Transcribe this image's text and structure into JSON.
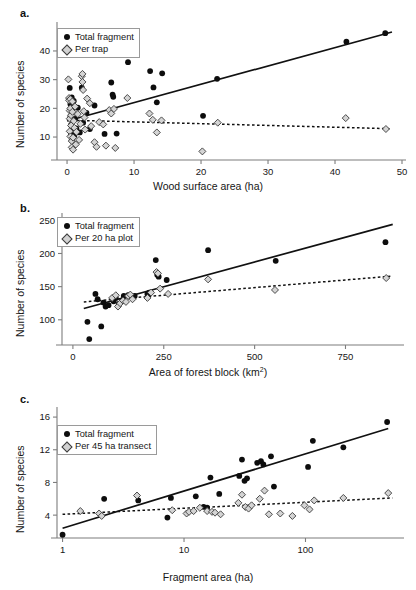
{
  "figure": {
    "panels": [
      {
        "label": "a.",
        "xlabel": "Wood surface area (ha)",
        "ylabel": "Number of species",
        "legend": [
          {
            "marker": "filled-circle",
            "label": "Total fragment"
          },
          {
            "marker": "gray-diamond",
            "label": "Per trap"
          }
        ]
      },
      {
        "label": "b.",
        "xlabel": "Area of forest block (km²)",
        "ylabel": "Number of species",
        "legend": [
          {
            "marker": "filled-circle",
            "label": "Total fragment"
          },
          {
            "marker": "gray-diamond",
            "label": "Per 20 ha plot"
          }
        ]
      },
      {
        "label": "c.",
        "xlabel": "Fragment area (ha)",
        "ylabel": "Number of species",
        "legend": [
          {
            "marker": "filled-circle",
            "label": "Total fragment"
          },
          {
            "marker": "gray-diamond",
            "label": "Per 45 ha transect"
          }
        ]
      }
    ]
  },
  "chart_data": [
    {
      "type": "scatter",
      "panel": "a.",
      "title": "",
      "xlabel": "Wood surface area (ha)",
      "ylabel": "Number of species",
      "xscale": "linear",
      "yscale": "linear",
      "xlim": [
        -1.5,
        50
      ],
      "ylim": [
        2,
        48
      ],
      "xticks": [
        0,
        10,
        20,
        30,
        40,
        50
      ],
      "yticks": [
        10,
        20,
        30,
        40
      ],
      "grid": false,
      "legend_position": "top-left",
      "series": [
        {
          "name": "Total fragment",
          "marker": "filled-circle",
          "color": "#0d0d0d",
          "points": [
            [
              0.4,
              27.1
            ],
            [
              0.5,
              21.5
            ],
            [
              0.5,
              17.0
            ],
            [
              0.6,
              14.2
            ],
            [
              0.6,
              11.0
            ],
            [
              0.7,
              23.8
            ],
            [
              0.7,
              9.0
            ],
            [
              0.8,
              19.5
            ],
            [
              0.9,
              12.4
            ],
            [
              1.0,
              22.6
            ],
            [
              1.1,
              10.5
            ],
            [
              1.2,
              16.3
            ],
            [
              1.4,
              13.0
            ],
            [
              1.6,
              20.2
            ],
            [
              1.9,
              11.6
            ],
            [
              2.2,
              27.2
            ],
            [
              2.4,
              15.0
            ],
            [
              2.9,
              18.4
            ],
            [
              3.4,
              12.8
            ],
            [
              4.1,
              21.0
            ],
            [
              5.6,
              11.1
            ],
            [
              6.6,
              29.0
            ],
            [
              6.8,
              24.8
            ],
            [
              6.9,
              24.0
            ],
            [
              7.4,
              11.2
            ],
            [
              9.1,
              36.1
            ],
            [
              12.4,
              33.0
            ],
            [
              12.9,
              27.3
            ],
            [
              13.4,
              22.1
            ],
            [
              14.2,
              32.2
            ],
            [
              20.3,
              17.4
            ],
            [
              22.4,
              30.3
            ],
            [
              41.7,
              43.2
            ],
            [
              47.5,
              46.2
            ]
          ]
        },
        {
          "name": "Per trap",
          "marker": "gray-diamond",
          "color": "#d2d2d2",
          "points": [
            [
              0.2,
              30.1
            ],
            [
              0.3,
              23.6
            ],
            [
              0.3,
              22.8
            ],
            [
              0.4,
              19.2
            ],
            [
              0.4,
              16.4
            ],
            [
              0.4,
              12.0
            ],
            [
              0.5,
              23.2
            ],
            [
              0.5,
              20.0
            ],
            [
              0.5,
              10.2
            ],
            [
              0.6,
              17.6
            ],
            [
              0.6,
              14.0
            ],
            [
              0.7,
              8.6
            ],
            [
              0.7,
              6.4
            ],
            [
              0.8,
              22.4
            ],
            [
              0.8,
              18.8
            ],
            [
              0.9,
              5.6
            ],
            [
              0.9,
              9.8
            ],
            [
              1.0,
              15.6
            ],
            [
              1.1,
              13.2
            ],
            [
              1.2,
              20.6
            ],
            [
              1.3,
              7.4
            ],
            [
              1.4,
              11.8
            ],
            [
              1.6,
              18.0
            ],
            [
              1.8,
              9.0
            ],
            [
              2.0,
              14.6
            ],
            [
              2.2,
              31.2
            ],
            [
              2.3,
              32.0
            ],
            [
              2.3,
              29.2
            ],
            [
              2.4,
              26.4
            ],
            [
              2.5,
              19.0
            ],
            [
              2.6,
              16.8
            ],
            [
              2.7,
              12.6
            ],
            [
              3.0,
              23.4
            ],
            [
              3.4,
              21.8
            ],
            [
              3.6,
              13.8
            ],
            [
              4.1,
              8.2
            ],
            [
              4.4,
              6.6
            ],
            [
              4.8,
              15.2
            ],
            [
              5.4,
              14.4
            ],
            [
              5.8,
              7.0
            ],
            [
              6.3,
              19.4
            ],
            [
              6.6,
              18.2
            ],
            [
              7.0,
              19.8
            ],
            [
              7.2,
              6.2
            ],
            [
              9.0,
              23.6
            ],
            [
              12.3,
              18.2
            ],
            [
              12.8,
              16.0
            ],
            [
              13.4,
              11.6
            ],
            [
              14.1,
              15.8
            ],
            [
              20.2,
              5.0
            ],
            [
              22.5,
              15.0
            ],
            [
              41.6,
              16.6
            ],
            [
              47.6,
              12.8
            ]
          ]
        }
      ],
      "trendlines": [
        {
          "name": "Total fragment fit",
          "style": "solid",
          "x": [
            0,
            48.5
          ],
          "y": [
            15.6,
            46.6
          ]
        },
        {
          "name": "Per trap fit",
          "style": "dashed",
          "x": [
            0,
            48.5
          ],
          "y": [
            15.9,
            12.9
          ]
        }
      ]
    },
    {
      "type": "scatter",
      "panel": "b.",
      "title": "",
      "xlabel": "Area of forest block (km²)",
      "ylabel": "Number of species",
      "xscale": "linear",
      "yscale": "linear",
      "xlim": [
        -30,
        900
      ],
      "ylim": [
        62,
        252
      ],
      "xticks": [
        0,
        250,
        500,
        750
      ],
      "yticks": [
        100,
        150,
        200,
        250
      ],
      "grid": false,
      "legend_position": "top-left",
      "series": [
        {
          "name": "Total fragment",
          "marker": "filled-circle",
          "color": "#0d0d0d",
          "points": [
            [
              40,
              97
            ],
            [
              45,
              71
            ],
            [
              62,
              139
            ],
            [
              68,
              131
            ],
            [
              78,
              90
            ],
            [
              84,
              126
            ],
            [
              90,
              120
            ],
            [
              98,
              122
            ],
            [
              112,
              128
            ],
            [
              118,
              133
            ],
            [
              126,
              124
            ],
            [
              140,
              136
            ],
            [
              152,
              137
            ],
            [
              156,
              135
            ],
            [
              170,
              136
            ],
            [
              205,
              139
            ],
            [
              210,
              141
            ],
            [
              228,
              190
            ],
            [
              232,
              168
            ],
            [
              236,
              165
            ],
            [
              258,
              160
            ],
            [
              372,
              205
            ],
            [
              558,
              189
            ],
            [
              860,
              217
            ]
          ]
        },
        {
          "name": "Per 20 ha plot",
          "marker": "gray-diamond",
          "color": "#d2d2d2",
          "points": [
            [
              108,
              133
            ],
            [
              118,
              137
            ],
            [
              124,
              120
            ],
            [
              130,
              125
            ],
            [
              138,
              129
            ],
            [
              146,
              127
            ],
            [
              152,
              136
            ],
            [
              158,
              138
            ],
            [
              164,
              131
            ],
            [
              205,
              133
            ],
            [
              215,
              141
            ],
            [
              230,
              172
            ],
            [
              234,
              170
            ],
            [
              240,
              147
            ],
            [
              262,
              139
            ],
            [
              372,
              161
            ],
            [
              556,
              145
            ],
            [
              862,
              163
            ]
          ]
        }
      ],
      "trendlines": [
        {
          "name": "Total fragment fit",
          "style": "solid",
          "x": [
            30,
            880
          ],
          "y": [
            117,
            244
          ]
        },
        {
          "name": "Per 20 ha plot fit",
          "style": "dashed",
          "x": [
            30,
            880
          ],
          "y": [
            127,
            166
          ]
        }
      ]
    },
    {
      "type": "scatter",
      "panel": "c.",
      "title": "",
      "xlabel": "Fragment area (ha)",
      "ylabel": "Number of species",
      "xscale": "log",
      "yscale": "linear",
      "xlim": [
        0.9,
        600
      ],
      "ylim": [
        1.2,
        16.5
      ],
      "xticks": [
        1,
        10,
        100
      ],
      "yticks": [
        4,
        8,
        12,
        16
      ],
      "grid": false,
      "legend_position": "top-left",
      "series": [
        {
          "name": "Total fragment",
          "marker": "filled-circle",
          "color": "#0d0d0d",
          "points": [
            [
              1.0,
              1.6
            ],
            [
              2.2,
              6.0
            ],
            [
              4.2,
              5.8
            ],
            [
              7.3,
              3.7
            ],
            [
              7.8,
              6.1
            ],
            [
              12.5,
              6.3
            ],
            [
              14.5,
              5.0
            ],
            [
              15.5,
              4.9
            ],
            [
              16.5,
              8.6
            ],
            [
              19.5,
              6.6
            ],
            [
              28.5,
              8.8
            ],
            [
              30.0,
              10.8
            ],
            [
              31.5,
              8.2
            ],
            [
              33.0,
              8.5
            ],
            [
              40.0,
              10.4
            ],
            [
              43.0,
              10.6
            ],
            [
              45.0,
              10.2
            ],
            [
              52.0,
              11.2
            ],
            [
              55.0,
              7.5
            ],
            [
              105.0,
              9.9
            ],
            [
              115.0,
              13.1
            ],
            [
              205.0,
              12.3
            ],
            [
              470.0,
              15.4
            ]
          ]
        },
        {
          "name": "Per 45 ha transect",
          "marker": "gray-diamond",
          "color": "#d2d2d2",
          "points": [
            [
              1.4,
              4.5
            ],
            [
              2.0,
              4.2
            ],
            [
              2.1,
              3.9
            ],
            [
              4.1,
              6.4
            ],
            [
              8.0,
              4.6
            ],
            [
              10.5,
              4.2
            ],
            [
              11.0,
              4.4
            ],
            [
              12.0,
              4.5
            ],
            [
              13.5,
              4.9
            ],
            [
              15.5,
              4.5
            ],
            [
              17.0,
              4.4
            ],
            [
              18.0,
              4.3
            ],
            [
              20.0,
              4.1
            ],
            [
              28.0,
              5.5
            ],
            [
              30.0,
              6.5
            ],
            [
              32.0,
              5.0
            ],
            [
              34.0,
              4.8
            ],
            [
              36.0,
              5.2
            ],
            [
              42.0,
              6.0
            ],
            [
              46.0,
              7.0
            ],
            [
              50.0,
              4.1
            ],
            [
              62.0,
              4.2
            ],
            [
              78.0,
              3.9
            ],
            [
              98.0,
              5.2
            ],
            [
              108.0,
              4.7
            ],
            [
              118.0,
              5.8
            ],
            [
              205.0,
              6.1
            ],
            [
              480.0,
              6.7
            ]
          ]
        }
      ],
      "trendlines": [
        {
          "name": "Total fragment fit",
          "style": "solid",
          "x": [
            1.0,
            480
          ],
          "y": [
            2.4,
            14.6
          ]
        },
        {
          "name": "Per 45 ha transect fit",
          "style": "dashed",
          "x": [
            1.0,
            520
          ],
          "y": [
            4.1,
            6.1
          ]
        }
      ]
    }
  ]
}
